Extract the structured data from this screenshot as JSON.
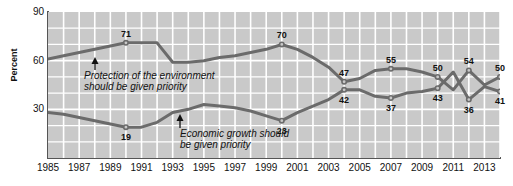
{
  "chart_data": {
    "type": "line",
    "title": "",
    "xlabel": "",
    "ylabel": "Percent",
    "ylim": [
      0,
      90
    ],
    "yticks": [
      30,
      60,
      90
    ],
    "grid": true,
    "legend": "none",
    "x": [
      1985,
      1986,
      1987,
      1988,
      1989,
      1990,
      1991,
      1992,
      1993,
      1994,
      1995,
      1996,
      1997,
      1998,
      1999,
      2000,
      2001,
      2002,
      2003,
      2004,
      2005,
      2006,
      2007,
      2008,
      2009,
      2010,
      2011,
      2012,
      2013,
      2014
    ],
    "xticks": [
      "1985",
      "1987",
      "1989",
      "1991",
      "1993",
      "1995",
      "1997",
      "1999",
      "2001",
      "2003",
      "2005",
      "2007",
      "2009",
      "2011",
      "2013"
    ],
    "series": [
      {
        "name": "Protection of the environment should be given priority",
        "values": [
          61,
          63,
          65,
          67,
          69,
          71,
          71,
          71,
          59,
          59,
          60,
          62,
          63,
          65,
          67,
          70,
          67,
          62,
          56,
          47,
          49,
          54,
          55,
          55,
          53,
          50,
          42,
          54,
          45,
          50
        ],
        "color": "#6b6b6b"
      },
      {
        "name": "Economic growth should be given priority",
        "values": [
          28,
          27,
          25,
          23,
          21,
          19,
          19,
          22,
          28,
          30,
          33,
          32,
          31,
          29,
          26,
          23,
          28,
          32,
          36,
          42,
          42,
          38,
          37,
          40,
          41,
          43,
          53,
          36,
          44,
          41
        ],
        "color": "#6b6b6b"
      }
    ],
    "point_labels": [
      {
        "series": 0,
        "year": 1990,
        "value": 71,
        "text": "71",
        "pos": "above"
      },
      {
        "series": 0,
        "year": 2000,
        "value": 70,
        "text": "70",
        "pos": "above"
      },
      {
        "series": 0,
        "year": 2004,
        "value": 47,
        "text": "47",
        "pos": "above"
      },
      {
        "series": 0,
        "year": 2007,
        "value": 55,
        "text": "55",
        "pos": "above"
      },
      {
        "series": 0,
        "year": 2010,
        "value": 50,
        "text": "50",
        "pos": "above"
      },
      {
        "series": 0,
        "year": 2012,
        "value": 54,
        "text": "54",
        "pos": "above"
      },
      {
        "series": 0,
        "year": 2014,
        "value": 50,
        "text": "50",
        "pos": "above"
      },
      {
        "series": 1,
        "year": 1990,
        "value": 19,
        "text": "19",
        "pos": "below"
      },
      {
        "series": 1,
        "year": 2000,
        "value": 23,
        "text": "23",
        "pos": "below"
      },
      {
        "series": 1,
        "year": 2004,
        "value": 42,
        "text": "42",
        "pos": "below"
      },
      {
        "series": 1,
        "year": 2007,
        "value": 37,
        "text": "37",
        "pos": "below"
      },
      {
        "series": 1,
        "year": 2010,
        "value": 43,
        "text": "43",
        "pos": "below"
      },
      {
        "series": 1,
        "year": 2012,
        "value": 36,
        "text": "36",
        "pos": "below"
      },
      {
        "series": 1,
        "year": 2014,
        "value": 41,
        "text": "41",
        "pos": "below"
      }
    ],
    "annotations": [
      {
        "id": "environment-annotation",
        "line1": "Protection of the environment",
        "line2": "should be given priority"
      },
      {
        "id": "economy-annotation",
        "line1": "Economic growth should",
        "line2": "be given priority"
      }
    ],
    "colors": {
      "plot_background": "#c9c9c9",
      "gridline": "#ffffff",
      "line": "#6b6b6b",
      "axis": "#555555",
      "text": "#111111"
    }
  }
}
